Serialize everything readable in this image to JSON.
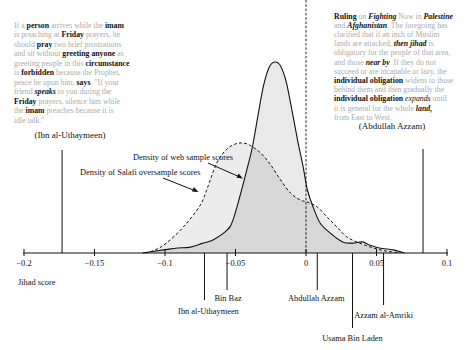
{
  "quotes": {
    "left": {
      "attribution": "(Ibn al-Uthaymeen)",
      "lines": [
        [
          [
            "g",
            "If a "
          ],
          [
            "b",
            "person"
          ],
          [
            "g",
            " arrives while the "
          ],
          [
            "b",
            "imam"
          ]
        ],
        [
          [
            "g",
            "is preaching at "
          ],
          [
            "b",
            "Friday"
          ],
          [
            "g",
            " prayers, he"
          ]
        ],
        [
          [
            "g",
            "should "
          ],
          [
            "b",
            "pray"
          ],
          [
            "g",
            " two brief prostrations"
          ]
        ],
        [
          [
            "g",
            "and sit without "
          ],
          [
            "b",
            "greeting anyone"
          ],
          [
            "g",
            " as"
          ]
        ],
        [
          [
            "g",
            "greeting people in this "
          ],
          [
            "b",
            "circumstance"
          ]
        ],
        [
          [
            "g",
            "is "
          ],
          [
            "b",
            "forbidden"
          ],
          [
            "g",
            " because the Prophet,"
          ]
        ],
        [
          [
            "g",
            "peace be upon him, "
          ],
          [
            "b",
            "says"
          ],
          [
            "g",
            ". \"If your"
          ]
        ],
        [
          [
            "g",
            "friend "
          ],
          [
            "bi",
            "speaks"
          ],
          [
            "g",
            " to you during the"
          ]
        ],
        [
          [
            "b",
            "Friday"
          ],
          [
            "g",
            " prayers, silence him while"
          ]
        ],
        [
          [
            "g",
            "the "
          ],
          [
            "b",
            "imam"
          ],
          [
            "g",
            " preaches because it is"
          ]
        ],
        [
          [
            "g",
            "idle talk.\""
          ]
        ]
      ]
    },
    "right": {
      "attribution": "(Abdullah Azzam)",
      "lines": [
        [
          [
            "b",
            "Ruling"
          ],
          [
            "g",
            " on "
          ],
          [
            "bi",
            "Fighting"
          ],
          [
            "g",
            " Now in "
          ],
          [
            "bi",
            "Palestine"
          ]
        ],
        [
          [
            "g",
            "and "
          ],
          [
            "bi",
            "Afghanistan"
          ],
          [
            "g",
            ". The foregoing has"
          ]
        ],
        [
          [
            "g",
            "clarified that if an inch of Muslim"
          ]
        ],
        [
          [
            "g",
            "lands are attacked, "
          ],
          [
            "bi",
            "then jihad"
          ],
          [
            "g",
            " is"
          ]
        ],
        [
          [
            "g",
            "obligatory for the people of that area,"
          ]
        ],
        [
          [
            "g",
            "and those "
          ],
          [
            "bi",
            "near by"
          ],
          [
            "g",
            ". If they do not"
          ]
        ],
        [
          [
            "g",
            "succeed or are incapable or lazy, the"
          ]
        ],
        [
          [
            "b",
            "individual obligation"
          ],
          [
            "g",
            " widens to those"
          ]
        ],
        [
          [
            "g",
            "behind them and then gradually the"
          ]
        ],
        [
          [
            "b",
            "individual obligation"
          ],
          [
            "g",
            " "
          ],
          [
            "i",
            "expands"
          ],
          [
            "g",
            " until"
          ]
        ],
        [
          [
            "g",
            "it is general for the whole "
          ],
          [
            "bi",
            "land,"
          ]
        ],
        [
          [
            "g",
            "from East to West."
          ]
        ]
      ]
    }
  },
  "chart_data": {
    "type": "area",
    "title": "",
    "xlabel": "Jihad score",
    "ylabel": "",
    "xlim": [
      -0.2,
      0.1
    ],
    "xticks": [
      -0.2,
      -0.15,
      -0.1,
      -0.05,
      0,
      0.05,
      0.1
    ],
    "xtick_labels": [
      "−0.2",
      "−0.15",
      "−0.1",
      "−0.05",
      "0",
      "0.05",
      "0.1"
    ],
    "grid": false,
    "reference_line": {
      "x": 0,
      "style": "dashed"
    },
    "density_units": "relative (web sample peak = 1.0)",
    "series": [
      {
        "name": "Density of web sample scores",
        "style": "solid",
        "x": [
          -0.116,
          -0.101,
          -0.091,
          -0.082,
          -0.073,
          -0.066,
          -0.056,
          -0.052,
          -0.047,
          -0.042,
          -0.038,
          -0.034,
          -0.03,
          -0.026,
          -0.022,
          -0.018,
          -0.014,
          -0.01,
          -0.006,
          -0.002,
          0.001,
          0.005,
          0.01,
          0.017,
          0.026,
          0.033,
          0.04,
          0.045,
          0.052,
          0.062,
          0.07
        ],
        "y": [
          0,
          0.016,
          0.026,
          0.031,
          0.052,
          0.068,
          0.12,
          0.168,
          0.293,
          0.435,
          0.555,
          0.723,
          0.88,
          0.974,
          1.0,
          0.979,
          0.895,
          0.749,
          0.592,
          0.45,
          0.33,
          0.241,
          0.157,
          0.105,
          0.058,
          0.052,
          0.058,
          0.042,
          0.026,
          0.016,
          0
        ]
      },
      {
        "name": "Density of Salafi oversample scores",
        "style": "dashed",
        "x": [
          -0.114,
          -0.107,
          -0.099,
          -0.087,
          -0.075,
          -0.07,
          -0.063,
          -0.056,
          -0.05,
          -0.045,
          -0.04,
          -0.033,
          -0.026,
          -0.018,
          -0.011,
          -0.004,
          0.001,
          0.008,
          0.015,
          0.022,
          0.029,
          0.038,
          0.048,
          0.057,
          0.067
        ],
        "y": [
          0,
          0.016,
          0.052,
          0.136,
          0.251,
          0.34,
          0.476,
          0.545,
          0.571,
          0.576,
          0.565,
          0.529,
          0.471,
          0.382,
          0.314,
          0.277,
          0.267,
          0.241,
          0.188,
          0.136,
          0.084,
          0.052,
          0.026,
          0.01,
          0
        ]
      }
    ],
    "annotations": [
      {
        "text": "Density of web sample scores",
        "points_to": "web sample curve"
      },
      {
        "text": "Density of Salafi oversample scores",
        "points_to": "Salafi oversample curve"
      }
    ],
    "markers": [
      {
        "label": "(Ibn al-Uthaymeen)",
        "score": -0.173,
        "kind": "quote"
      },
      {
        "label": "(Abdullah Azzam)",
        "score": 0.083,
        "kind": "quote"
      },
      {
        "label": "Ibn al-Uthaymeen",
        "score": -0.072,
        "kind": "author"
      },
      {
        "label": "Bin Baz",
        "score": -0.056,
        "kind": "author"
      },
      {
        "label": "Abdullah Azzam",
        "score": 0.008,
        "kind": "author"
      },
      {
        "label": "Usama Bin Laden",
        "score": 0.033,
        "kind": "author"
      },
      {
        "label": "Azzam al-Amriki",
        "score": 0.055,
        "kind": "author"
      }
    ]
  }
}
